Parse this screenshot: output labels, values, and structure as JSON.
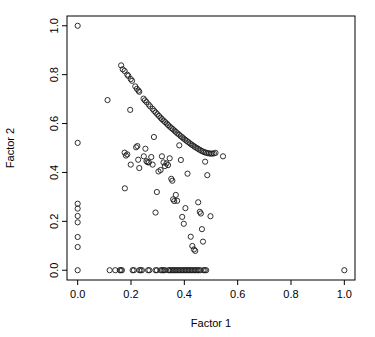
{
  "chart_data": {
    "type": "scatter",
    "title": "",
    "xlabel": "Factor 1",
    "ylabel": "Factor 2",
    "xlim": [
      -0.04,
      1.04
    ],
    "ylim": [
      -0.04,
      1.04
    ],
    "xticks": [
      0.0,
      0.2,
      0.4,
      0.6,
      0.8,
      1.0
    ],
    "yticks": [
      0.0,
      0.2,
      0.4,
      0.6,
      0.8,
      1.0
    ],
    "xticklabels": [
      "0.0",
      "0.2",
      "0.4",
      "0.6",
      "0.8",
      "1.0"
    ],
    "yticklabels": [
      "0.0",
      "0.2",
      "0.4",
      "0.6",
      "0.8",
      "1.0"
    ],
    "grid": false,
    "legend": null,
    "marker": "open-circle",
    "marker_color": "#1a1a1a",
    "marker_radius": 2.6,
    "background": "#ffffff",
    "frame_color": "#000000",
    "series": [
      {
        "name": "observations",
        "points": [
          [
            0.0,
            1.0
          ],
          [
            0.0,
            0.521
          ],
          [
            0.0,
            0.272
          ],
          [
            0.0,
            0.252
          ],
          [
            0.0,
            0.222
          ],
          [
            0.0,
            0.196
          ],
          [
            0.0,
            0.136
          ],
          [
            0.0,
            0.095
          ],
          [
            0.0,
            0.0
          ],
          [
            1.0,
            0.0
          ],
          [
            0.163,
            0.838
          ],
          [
            0.169,
            0.822
          ],
          [
            0.176,
            0.815
          ],
          [
            0.186,
            0.8
          ],
          [
            0.19,
            0.795
          ],
          [
            0.199,
            0.782
          ],
          [
            0.204,
            0.775
          ],
          [
            0.216,
            0.752
          ],
          [
            0.222,
            0.742
          ],
          [
            0.228,
            0.735
          ],
          [
            0.231,
            0.73
          ],
          [
            0.247,
            0.702
          ],
          [
            0.252,
            0.695
          ],
          [
            0.258,
            0.688
          ],
          [
            0.266,
            0.678
          ],
          [
            0.272,
            0.67
          ],
          [
            0.281,
            0.66
          ],
          [
            0.287,
            0.652
          ],
          [
            0.293,
            0.645
          ],
          [
            0.299,
            0.638
          ],
          [
            0.305,
            0.631
          ],
          [
            0.311,
            0.624
          ],
          [
            0.316,
            0.618
          ],
          [
            0.322,
            0.612
          ],
          [
            0.328,
            0.606
          ],
          [
            0.334,
            0.6
          ],
          [
            0.339,
            0.594
          ],
          [
            0.345,
            0.588
          ],
          [
            0.351,
            0.582
          ],
          [
            0.357,
            0.577
          ],
          [
            0.363,
            0.571
          ],
          [
            0.368,
            0.566
          ],
          [
            0.374,
            0.56
          ],
          [
            0.38,
            0.555
          ],
          [
            0.386,
            0.549
          ],
          [
            0.392,
            0.544
          ],
          [
            0.397,
            0.539
          ],
          [
            0.403,
            0.534
          ],
          [
            0.409,
            0.529
          ],
          [
            0.415,
            0.524
          ],
          [
            0.421,
            0.519
          ],
          [
            0.427,
            0.514
          ],
          [
            0.433,
            0.51
          ],
          [
            0.439,
            0.505
          ],
          [
            0.445,
            0.501
          ],
          [
            0.451,
            0.497
          ],
          [
            0.457,
            0.493
          ],
          [
            0.463,
            0.489
          ],
          [
            0.469,
            0.486
          ],
          [
            0.475,
            0.483
          ],
          [
            0.481,
            0.481
          ],
          [
            0.487,
            0.479
          ],
          [
            0.493,
            0.478
          ],
          [
            0.499,
            0.477
          ],
          [
            0.505,
            0.477
          ],
          [
            0.511,
            0.478
          ],
          [
            0.517,
            0.48
          ],
          [
            0.545,
            0.466
          ],
          [
            0.112,
            0.696
          ],
          [
            0.197,
            0.656
          ],
          [
            0.176,
            0.481
          ],
          [
            0.181,
            0.469
          ],
          [
            0.186,
            0.474
          ],
          [
            0.177,
            0.335
          ],
          [
            0.199,
            0.432
          ],
          [
            0.219,
            0.503
          ],
          [
            0.224,
            0.508
          ],
          [
            0.227,
            0.452
          ],
          [
            0.231,
            0.418
          ],
          [
            0.248,
            0.466
          ],
          [
            0.254,
            0.497
          ],
          [
            0.258,
            0.446
          ],
          [
            0.262,
            0.442
          ],
          [
            0.267,
            0.441
          ],
          [
            0.276,
            0.463
          ],
          [
            0.281,
            0.432
          ],
          [
            0.286,
            0.545
          ],
          [
            0.292,
            0.236
          ],
          [
            0.297,
            0.32
          ],
          [
            0.303,
            0.404
          ],
          [
            0.311,
            0.41
          ],
          [
            0.316,
            0.466
          ],
          [
            0.322,
            0.441
          ],
          [
            0.327,
            0.426
          ],
          [
            0.333,
            0.437
          ],
          [
            0.339,
            0.43
          ],
          [
            0.345,
            0.458
          ],
          [
            0.351,
            0.374
          ],
          [
            0.355,
            0.366
          ],
          [
            0.358,
            0.29
          ],
          [
            0.362,
            0.283
          ],
          [
            0.368,
            0.308
          ],
          [
            0.373,
            0.284
          ],
          [
            0.381,
            0.511
          ],
          [
            0.387,
            0.451
          ],
          [
            0.392,
            0.218
          ],
          [
            0.398,
            0.19
          ],
          [
            0.404,
            0.254
          ],
          [
            0.412,
            0.395
          ],
          [
            0.424,
            0.137
          ],
          [
            0.43,
            0.099
          ],
          [
            0.436,
            0.085
          ],
          [
            0.441,
            0.079
          ],
          [
            0.452,
            0.278
          ],
          [
            0.458,
            0.239
          ],
          [
            0.462,
            0.232
          ],
          [
            0.466,
            0.168
          ],
          [
            0.47,
            0.117
          ],
          [
            0.478,
            0.444
          ],
          [
            0.486,
            0.389
          ],
          [
            0.498,
            0.221
          ],
          [
            0.12,
            0.0
          ],
          [
            0.141,
            0.0
          ],
          [
            0.158,
            0.0
          ],
          [
            0.162,
            0.0
          ],
          [
            0.166,
            0.0
          ],
          [
            0.206,
            0.0
          ],
          [
            0.211,
            0.0
          ],
          [
            0.231,
            0.0
          ],
          [
            0.236,
            0.0
          ],
          [
            0.241,
            0.0
          ],
          [
            0.264,
            0.0
          ],
          [
            0.269,
            0.0
          ],
          [
            0.292,
            0.0
          ],
          [
            0.297,
            0.0
          ],
          [
            0.312,
            0.0
          ],
          [
            0.317,
            0.0
          ],
          [
            0.322,
            0.0
          ],
          [
            0.327,
            0.0
          ],
          [
            0.34,
            0.0
          ],
          [
            0.345,
            0.0
          ],
          [
            0.35,
            0.0
          ],
          [
            0.356,
            0.0
          ],
          [
            0.361,
            0.0
          ],
          [
            0.366,
            0.0
          ],
          [
            0.372,
            0.0
          ],
          [
            0.377,
            0.0
          ],
          [
            0.383,
            0.0
          ],
          [
            0.388,
            0.0
          ],
          [
            0.394,
            0.0
          ],
          [
            0.399,
            0.0
          ],
          [
            0.405,
            0.0
          ],
          [
            0.41,
            0.0
          ],
          [
            0.416,
            0.0
          ],
          [
            0.421,
            0.0
          ],
          [
            0.427,
            0.0
          ],
          [
            0.432,
            0.0
          ],
          [
            0.438,
            0.0
          ],
          [
            0.443,
            0.0
          ],
          [
            0.449,
            0.0
          ],
          [
            0.454,
            0.0
          ],
          [
            0.46,
            0.0
          ],
          [
            0.472,
            0.0
          ],
          [
            0.477,
            0.0
          ],
          [
            0.482,
            0.0
          ]
        ]
      }
    ]
  }
}
